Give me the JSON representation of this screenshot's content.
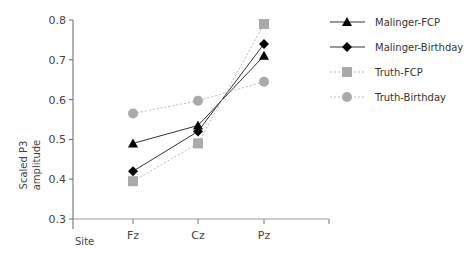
{
  "chart_data": {
    "type": "line",
    "title": "",
    "xlabel": "Site",
    "ylabel": "Scaled P3 amplitude",
    "categories": [
      "Fz",
      "Cz",
      "Pz"
    ],
    "ylim": [
      0.3,
      0.8
    ],
    "yticks": [
      "0.3",
      "0.4",
      "0.5",
      "0.6",
      "0.7",
      "0.8"
    ],
    "grid": false,
    "legend_position": "right",
    "series": [
      {
        "name": "Malinger-FCP",
        "values": [
          0.49,
          0.535,
          0.71
        ],
        "marker": "triangle",
        "color": "#000000",
        "line": "solid"
      },
      {
        "name": "Malinger-Birthday",
        "values": [
          0.42,
          0.52,
          0.74
        ],
        "marker": "diamond",
        "color": "#000000",
        "line": "solid"
      },
      {
        "name": "Truth-FCP",
        "values": [
          0.395,
          0.49,
          0.79
        ],
        "marker": "square",
        "color": "#aaaaaa",
        "line": "dotted"
      },
      {
        "name": "Truth-Birthday",
        "values": [
          0.565,
          0.597,
          0.645
        ],
        "marker": "circle",
        "color": "#aaaaaa",
        "line": "dotted"
      }
    ]
  },
  "axis": {
    "ylabel_line1": "Scaled P3",
    "ylabel_line2": "amplitude",
    "xlabel": "Site"
  }
}
